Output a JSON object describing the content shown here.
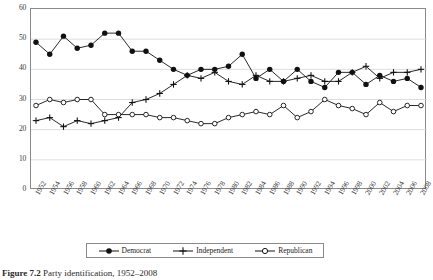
{
  "caption": {
    "label": "Figure 7.2",
    "text": "Party identification, 1952–2008"
  },
  "legend": {
    "position": "bottom",
    "items": [
      {
        "label": "Democrat",
        "marker": "filled-circle-marker"
      },
      {
        "label": "Independent",
        "marker": "plus-marker"
      },
      {
        "label": "Republican",
        "marker": "open-circle-marker"
      }
    ]
  },
  "chart_data": {
    "type": "line",
    "title": "Party identification, 1952–2008",
    "xlabel": "",
    "ylabel": "",
    "ylim": [
      0,
      60
    ],
    "yticks": [
      0,
      10,
      20,
      30,
      40,
      50,
      60
    ],
    "grid": true,
    "legend_position": "bottom",
    "categories": [
      "1952",
      "1954",
      "1956",
      "1958",
      "1960",
      "1962",
      "1964",
      "1966",
      "1968",
      "1970",
      "1972",
      "1974",
      "1976",
      "1978",
      "1980",
      "1982",
      "1984",
      "1986",
      "1988",
      "1990",
      "1992",
      "1994",
      "1996",
      "1998",
      "2000",
      "2002",
      "2004",
      "2006",
      "2008"
    ],
    "series": [
      {
        "name": "Democrat",
        "marker": "filled-circle-marker",
        "color": "#111111",
        "values": [
          49,
          45,
          51,
          47,
          48,
          52,
          52,
          46,
          46,
          43,
          40,
          38,
          40,
          40,
          41,
          45,
          37,
          40,
          36,
          40,
          36,
          34,
          39,
          39,
          35,
          38,
          36,
          37,
          34
        ]
      },
      {
        "name": "Independent",
        "marker": "plus-marker",
        "color": "#111111",
        "values": [
          23,
          24,
          21,
          23,
          22,
          23,
          24,
          29,
          30,
          32,
          35,
          38,
          37,
          39,
          36,
          35,
          38,
          36,
          36,
          37,
          38,
          36,
          36,
          39,
          41,
          37,
          39,
          39,
          40
        ]
      },
      {
        "name": "Republican",
        "marker": "open-circle-marker",
        "color": "#111111",
        "values": [
          28,
          30,
          29,
          30,
          30,
          25,
          25,
          25,
          25,
          24,
          24,
          23,
          22,
          22,
          24,
          25,
          26,
          25,
          28,
          24,
          26,
          30,
          28,
          27,
          25,
          29,
          26,
          28,
          28
        ]
      }
    ]
  }
}
